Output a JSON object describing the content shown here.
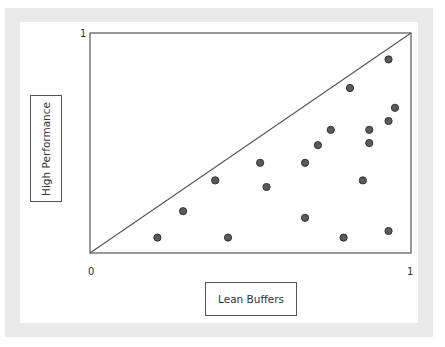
{
  "chart_data": {
    "type": "scatter",
    "title": "",
    "xlabel": "Lean Buffers",
    "ylabel": "High Performance",
    "xlim": [
      0,
      1
    ],
    "ylim": [
      0,
      1
    ],
    "x_ticks": [
      "0",
      "1"
    ],
    "y_ticks": [
      "0",
      "1"
    ],
    "grid": false,
    "legend": null,
    "annotations": [
      "diagonal reference line y = x from (0,0) to (1,1)"
    ],
    "series": [
      {
        "name": "points",
        "color": "#555555",
        "points": [
          {
            "x": 0.21,
            "y": 0.07
          },
          {
            "x": 0.29,
            "y": 0.19
          },
          {
            "x": 0.39,
            "y": 0.33
          },
          {
            "x": 0.43,
            "y": 0.07
          },
          {
            "x": 0.53,
            "y": 0.41
          },
          {
            "x": 0.55,
            "y": 0.3
          },
          {
            "x": 0.67,
            "y": 0.41
          },
          {
            "x": 0.67,
            "y": 0.16
          },
          {
            "x": 0.71,
            "y": 0.49
          },
          {
            "x": 0.75,
            "y": 0.56
          },
          {
            "x": 0.79,
            "y": 0.07
          },
          {
            "x": 0.81,
            "y": 0.75
          },
          {
            "x": 0.85,
            "y": 0.33
          },
          {
            "x": 0.87,
            "y": 0.56
          },
          {
            "x": 0.87,
            "y": 0.5
          },
          {
            "x": 0.93,
            "y": 0.6
          },
          {
            "x": 0.93,
            "y": 0.88
          },
          {
            "x": 0.93,
            "y": 0.1
          },
          {
            "x": 0.95,
            "y": 0.66
          }
        ]
      }
    ]
  },
  "labels": {
    "y_axis": "High Performance",
    "x_axis": "Lean Buffers",
    "origin": "0",
    "x_max": "1",
    "y_max": "1"
  },
  "colors": {
    "frame_band": "#e9e9e9",
    "axis_line": "#555555",
    "dot_fill": "#5a5a5a",
    "dot_stroke": "#333333"
  }
}
